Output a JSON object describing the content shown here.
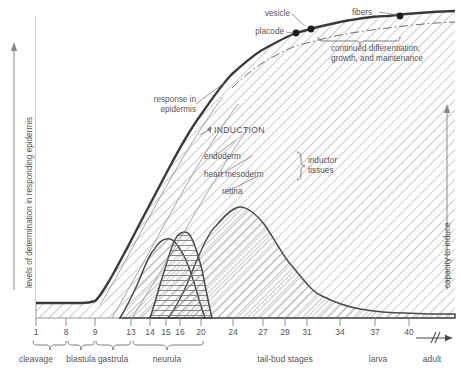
{
  "figure": {
    "type": "line",
    "axis_left_label": "levels of determination in responding epidermis",
    "axis_right_label": "capacity to induce"
  },
  "annotations": {
    "response": "response in\nepidermis",
    "response_l1": "response in",
    "response_l2": "epidermis",
    "induction": "INDUCTION",
    "endoderm": "endoderm",
    "heart_mesoderm": "heart mesoderm",
    "retina": "retina",
    "inductor_l1": "inductor",
    "inductor_l2": "tissues",
    "placode": "placode",
    "vesicle": "vesicle",
    "fibers": "fibers",
    "continued_l1": "continued differentiation,",
    "continued_l2": "growth, and maintenance"
  },
  "xaxis": {
    "ticks": [
      {
        "label": "1",
        "x": 36
      },
      {
        "label": "8",
        "x": 66
      },
      {
        "label": "9",
        "x": 95
      },
      {
        "label": "13",
        "x": 131
      },
      {
        "label": "14",
        "x": 150
      },
      {
        "label": "15",
        "x": 166
      },
      {
        "label": "16",
        "x": 180
      },
      {
        "label": "20",
        "x": 201
      },
      {
        "label": "24",
        "x": 233
      },
      {
        "label": "27",
        "x": 263
      },
      {
        "label": "29",
        "x": 285
      },
      {
        "label": "31",
        "x": 307
      },
      {
        "label": "34",
        "x": 340
      },
      {
        "label": "37",
        "x": 375
      },
      {
        "label": "40",
        "x": 409
      }
    ],
    "stages": [
      {
        "label": "cleavage",
        "x": 36,
        "x0": 33,
        "x1": 66
      },
      {
        "label": "blastula",
        "x": 81,
        "x0": 68,
        "x1": 94
      },
      {
        "label": "gastrula",
        "x": 113,
        "x0": 96,
        "x1": 130
      },
      {
        "label": "neurula",
        "x": 167,
        "x0": 133,
        "x1": 203
      },
      {
        "label": "tail-bud stages",
        "x": 285,
        "x0": null,
        "x1": null
      },
      {
        "label": "larva",
        "x": 378,
        "x0": null,
        "x1": null
      },
      {
        "label": "adult",
        "x": 432,
        "x0": null,
        "x1": null
      }
    ]
  },
  "chart_data": {
    "type": "line",
    "title": "",
    "xlabel": "",
    "ylabel": "levels of determination in responding epidermis",
    "y2label": "capacity to induce",
    "stage_ticks": [
      1,
      8,
      9,
      13,
      14,
      15,
      16,
      20,
      24,
      27,
      29,
      31,
      34,
      37,
      40
    ],
    "series": [
      {
        "name": "response in epidermis",
        "style": "thick-solid",
        "points": [
          [
            36,
            303
          ],
          [
            60,
            303
          ],
          [
            82,
            303
          ],
          [
            95,
            301
          ],
          [
            103,
            292
          ],
          [
            112,
            276
          ],
          [
            124,
            254
          ],
          [
            138,
            227
          ],
          [
            152,
            200
          ],
          [
            168,
            170
          ],
          [
            184,
            142
          ],
          [
            200,
            116
          ],
          [
            216,
            93
          ],
          [
            232,
            74
          ],
          [
            248,
            60
          ],
          [
            264,
            49
          ],
          [
            280,
            40
          ],
          [
            296,
            33
          ],
          [
            316,
            27
          ],
          [
            340,
            22
          ],
          [
            364,
            19
          ],
          [
            388,
            16
          ],
          [
            412,
            14
          ],
          [
            436,
            12
          ],
          [
            455,
            11
          ]
        ]
      },
      {
        "name": "inductor boundary (dashed)",
        "style": "dash-dot",
        "points": [
          [
            232,
            88
          ],
          [
            248,
            73
          ],
          [
            264,
            62
          ],
          [
            280,
            53
          ],
          [
            296,
            46
          ],
          [
            316,
            40
          ],
          [
            340,
            35
          ],
          [
            364,
            31
          ],
          [
            388,
            28
          ],
          [
            412,
            25
          ],
          [
            436,
            23
          ],
          [
            455,
            22
          ]
        ]
      },
      {
        "name": "endoderm",
        "style": "hatch-diagonal",
        "peak_stage": 15,
        "points": [
          [
            120,
            318
          ],
          [
            130,
            300
          ],
          [
            138,
            283
          ],
          [
            146,
            265
          ],
          [
            154,
            250
          ],
          [
            162,
            241
          ],
          [
            170,
            239
          ],
          [
            178,
            245
          ],
          [
            186,
            260
          ],
          [
            194,
            283
          ],
          [
            200,
            303
          ],
          [
            205,
            318
          ]
        ]
      },
      {
        "name": "heart mesoderm",
        "style": "hatch-horizontal",
        "peak_stage": 16,
        "points": [
          [
            150,
            318
          ],
          [
            158,
            294
          ],
          [
            164,
            272
          ],
          [
            170,
            252
          ],
          [
            176,
            238
          ],
          [
            182,
            232
          ],
          [
            189,
            234
          ],
          [
            196,
            248
          ],
          [
            202,
            270
          ],
          [
            208,
            296
          ],
          [
            212,
            318
          ]
        ]
      },
      {
        "name": "retina",
        "style": "hatch-diagonal",
        "peak_stage": 22,
        "points": [
          [
            168,
            318
          ],
          [
            180,
            296
          ],
          [
            192,
            272
          ],
          [
            204,
            248
          ],
          [
            216,
            226
          ],
          [
            228,
            212
          ],
          [
            240,
            207
          ],
          [
            252,
            211
          ],
          [
            264,
            224
          ],
          [
            278,
            245
          ],
          [
            292,
            266
          ],
          [
            306,
            283
          ],
          [
            322,
            296
          ],
          [
            340,
            304
          ],
          [
            360,
            309
          ],
          [
            382,
            312
          ],
          [
            404,
            313
          ],
          [
            430,
            314
          ],
          [
            455,
            314
          ]
        ]
      }
    ],
    "markers": [
      {
        "label": "placode",
        "x": 296,
        "y": 28
      },
      {
        "label": "vesicle",
        "x": 310,
        "y": 26
      },
      {
        "label": "fibers",
        "x": 400,
        "y": 18
      }
    ],
    "grid": false,
    "legend": "none"
  }
}
